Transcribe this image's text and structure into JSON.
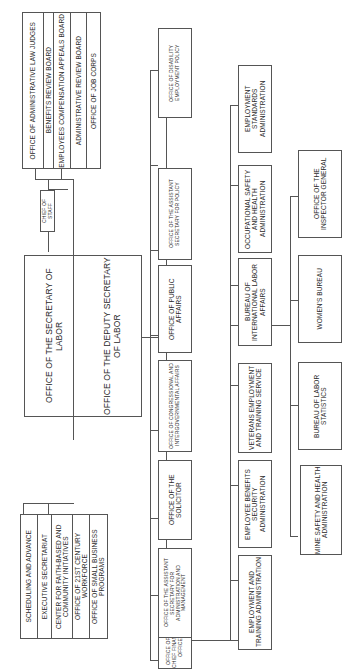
{
  "chart": {
    "orientation": "rotated-90-ccw",
    "secretary": "OFFICE OF THE SECRETARY OF LABOR",
    "deputy": "OFFICE OF THE DEPUTY SECRETARY OF LABOR",
    "chief_of_staff": "CHIEF OF STAFF",
    "top_staff_offices": [
      "OFFICE OF ADMINISTRATIVE LAW JUDGES",
      "BENEFITS REVIEW BOARD",
      "EMPLOYEES COMPENSATION APPEALS BOARD",
      "ADMINISTRATIVE REVIEW BOARD",
      "OFFICE OF JOB CORPS"
    ],
    "bottom_staff_offices": [
      "SCHEDULING AND ADVANCE",
      "EXECUTIVE SECRETARIAT",
      "CENTER FOR FAITH-BASED AND COMMUNITY INITIATIVES",
      "OFFICE OF 21ST CENTURY WORKFORCE",
      "OFFICE OF SMALL BUSINESS PROGRAMS"
    ],
    "row1": [
      "OFFICE OF THE CHIEF FINANCIAL OFFICER",
      "OFFICE OF THE ASSISTANT SECRETARY FOR ADMINISTRATION AND MANAGEMENT",
      "OFFICE OF THE SOLICITOR",
      "OFFICE OF CONGRESSIONAL AND INTERGOVERNMENTAL AFFAIRS",
      "OFFICE OF PUBLIC AFFAIRS",
      "OFFICE OF THE ASSISTANT SECRETARY FOR POLICY",
      "OFFICE OF DISABILITY EMPLOYMENT POLICY"
    ],
    "row2": [
      "EMPLOYMENT AND TRAINING ADMINISTRATION",
      "EMPLOYEE BENEFITS SECURITY ADMINISTRATION",
      "VETERANS EMPLOYMENT AND TRAINING SERVICE",
      "BUREAU OF INTERNATIONAL LABOR AFFAIRS",
      "OCCUPATIONAL SAFETY AND HEALTH ADMINISTRATION",
      "EMPLOYMENT STANDARDS ADMINISTRATION"
    ],
    "row3": [
      "MINE SAFETY AND HEALTH ADMINISTRATION",
      "BUREAU OF LABOR STATISTICS",
      "WOMEN'S BUREAU",
      "OFFICE OF THE INSPECTOR GENERAL"
    ]
  }
}
